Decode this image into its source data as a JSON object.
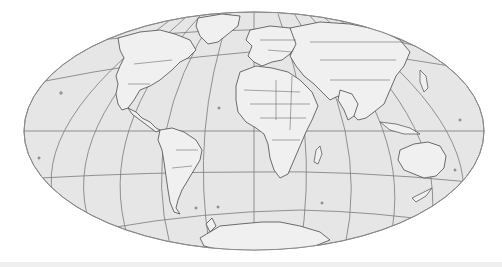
{
  "map": {
    "projection": "oblique pseudocylindrical (Mollweide-like) world map",
    "style": "grayscale",
    "colors": {
      "background": "#ffffff",
      "ocean": "#e6e6e6",
      "land": "#f0f0f0",
      "coastline": "#4a4a4a",
      "graticule": "#7a7a7a",
      "outline": "#8a8a8a",
      "bottom_strip": "#efefef"
    },
    "outline": {
      "cx": 254,
      "cy": 131,
      "rx": 230,
      "ry": 119
    },
    "graticule": {
      "parallels": [
        "north-60",
        "north-30",
        "equator",
        "south-30",
        "south-60"
      ],
      "meridian_count": 12
    },
    "regions": [
      "North America",
      "South America",
      "Greenland",
      "Europe",
      "Africa",
      "Asia",
      "Australia",
      "Antarctica",
      "Madagascar",
      "New Zealand"
    ]
  }
}
